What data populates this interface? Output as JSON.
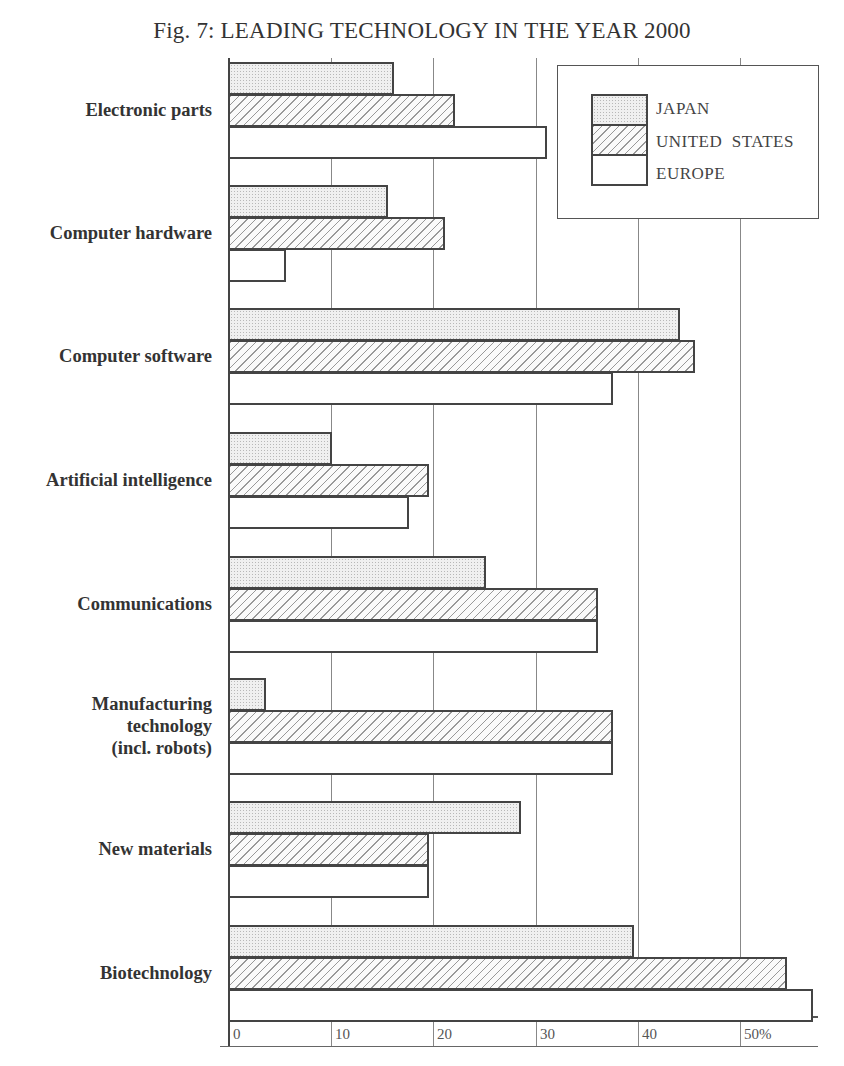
{
  "title": "Fig. 7: LEADING TECHNOLOGY IN THE YEAR 2000",
  "legend": [
    {
      "key": "japan",
      "label": "JAPAN"
    },
    {
      "key": "us",
      "label": "UNITED  STATES"
    },
    {
      "key": "europe",
      "label": "EUROPE"
    }
  ],
  "x_ticks": [
    "0",
    "10",
    "20",
    "30",
    "40",
    "50%"
  ],
  "chart_data": {
    "type": "bar",
    "orientation": "horizontal",
    "title": "Fig. 7: LEADING TECHNOLOGY IN THE YEAR 2000",
    "xlabel": "%",
    "ylabel": "",
    "xlim": [
      0,
      57
    ],
    "x_ticks": [
      0,
      10,
      20,
      30,
      40,
      50
    ],
    "grid": true,
    "legend_position": "upper right",
    "categories": [
      "Electronic parts",
      "Computer hardware",
      "Computer software",
      "Artificial intelligence",
      "Communications",
      "Manufacturing\ntechnology\n(incl. robots)",
      "New materials",
      "Biotechnology"
    ],
    "series": [
      {
        "name": "JAPAN",
        "pattern": "dotted",
        "values": [
          16,
          15.5,
          44,
          10,
          25,
          3.5,
          28.5,
          39.5
        ]
      },
      {
        "name": "UNITED STATES",
        "pattern": "hatched",
        "values": [
          22,
          21,
          45.5,
          19.5,
          36,
          37.5,
          19.5,
          54.5
        ]
      },
      {
        "name": "EUROPE",
        "pattern": "blank",
        "values": [
          31,
          5.5,
          37.5,
          17.5,
          36,
          37.5,
          19.5,
          57
        ]
      }
    ]
  }
}
